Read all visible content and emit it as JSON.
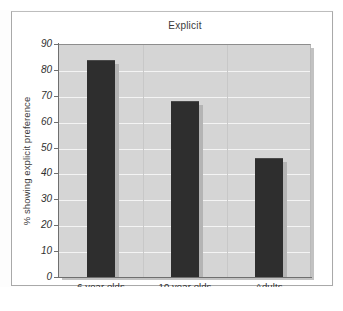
{
  "figure": {
    "frame_color": "#a9a9a9",
    "page_background": "#ffffff"
  },
  "chart_data": {
    "type": "bar",
    "title": "Explicit",
    "xlabel": "",
    "ylabel": "% showing explicit preference",
    "categories": [
      "6 year olds",
      "10 year olds",
      "Adults"
    ],
    "values": [
      84,
      68,
      46
    ],
    "ylim": [
      0,
      90
    ],
    "ytick_labels": [
      "90",
      "80",
      "70",
      "60",
      "50",
      "40",
      "30",
      "20",
      "10",
      "0"
    ],
    "ytick_values": [
      90,
      80,
      70,
      60,
      50,
      40,
      30,
      20,
      10,
      0
    ],
    "ytick_step": 10,
    "grid": "horizontal",
    "legend": "none",
    "bar_color": "#2e2e2e",
    "plot_background": "#d5d5d5",
    "gridline_color": "#f4f4f4",
    "annotations": []
  }
}
